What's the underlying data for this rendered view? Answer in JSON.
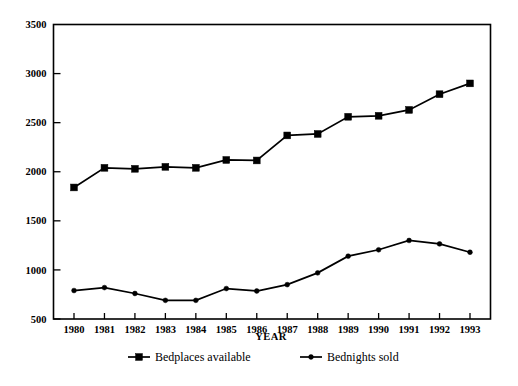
{
  "chart_data": {
    "type": "line",
    "title": "",
    "xlabel": "YEAR",
    "ylabel": "",
    "x": [
      1980,
      1981,
      1982,
      1983,
      1984,
      1985,
      1986,
      1987,
      1988,
      1989,
      1990,
      1991,
      1992,
      1993
    ],
    "categories": [
      "1980",
      "1981",
      "1982",
      "1983",
      "1984",
      "1985",
      "1986",
      "1987",
      "1988",
      "1989",
      "1990",
      "1991",
      "1992",
      "1993"
    ],
    "xtick_labels": [
      "1980",
      "1981",
      "1982",
      "1983",
      "1984",
      "1985",
      "1986",
      "1987",
      "1988",
      "1989",
      "1990",
      "1991",
      "1992",
      "1993"
    ],
    "ytick_labels": [
      "3500",
      "3000",
      "2500",
      "2000",
      "1500",
      "1000",
      "500"
    ],
    "yticks": [
      3500,
      3000,
      2500,
      2000,
      1500,
      1000,
      500
    ],
    "ylim": [
      500,
      3500
    ],
    "xlim": [
      1980,
      1993
    ],
    "grid": false,
    "legend_position": "bottom-center",
    "series": [
      {
        "name": "Bedplaces available",
        "marker": "square",
        "color": "#000000",
        "values": [
          1840,
          2040,
          2030,
          2050,
          2040,
          2120,
          2115,
          2370,
          2385,
          2560,
          2570,
          2630,
          2790,
          2900
        ]
      },
      {
        "name": "Bednights sold",
        "marker": "dot",
        "color": "#000000",
        "values": [
          790,
          820,
          760,
          690,
          690,
          810,
          785,
          850,
          970,
          1140,
          1205,
          1300,
          1265,
          1180
        ]
      }
    ]
  },
  "legend": {
    "items": [
      {
        "label": "Bedplaces available",
        "marker": "square"
      },
      {
        "label": "Bednights sold",
        "marker": "dot"
      }
    ]
  },
  "axis": {
    "x_title": "YEAR"
  }
}
